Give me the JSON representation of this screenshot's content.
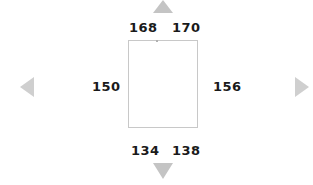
{
  "labels": {
    "top_left": "168",
    "top_right": "170",
    "left": "150",
    "right": "156",
    "bottom_left": "134",
    "bottom_right": "138"
  },
  "colors": {
    "arrow": "#c4c4c4",
    "box_border": "#c8c8c8",
    "text": "#1a1a1a"
  },
  "icons": {
    "up": "triangle-up-icon",
    "down": "triangle-down-icon",
    "left": "triangle-left-icon",
    "right": "triangle-right-icon"
  }
}
